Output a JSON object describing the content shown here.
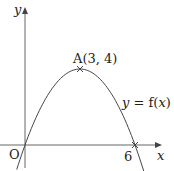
{
  "chart_data": {
    "type": "line",
    "title": "",
    "xlabel": "x",
    "ylabel": "y",
    "curve_label_prefix": "y = f(",
    "curve_label_var": "x",
    "curve_label_suffix": ")",
    "function": "f(x) = -4/9 * x * (x - 6)",
    "points": [
      {
        "label": "O",
        "x": 0,
        "y": 0
      },
      {
        "label": "A(3, 4)",
        "x": 3,
        "y": 4
      },
      {
        "label": "6",
        "x": 6,
        "y": 0
      }
    ],
    "x": [
      -0.3,
      0,
      1,
      2,
      3,
      4,
      5,
      6,
      6.5
    ],
    "values": [
      -0.84,
      0,
      2.22,
      3.56,
      4,
      3.56,
      2.22,
      0,
      -1.44
    ],
    "grid": false,
    "legend": "none"
  },
  "labels": {
    "y_axis": "y",
    "x_axis": "x",
    "origin": "O",
    "x_intercept": "6",
    "vertex": "A(3, 4)",
    "curve_prefix": "y = f(",
    "curve_var": "x",
    "curve_suffix": ")"
  },
  "colors": {
    "axis": "#555555",
    "curve": "#444444",
    "text": "#222222"
  }
}
